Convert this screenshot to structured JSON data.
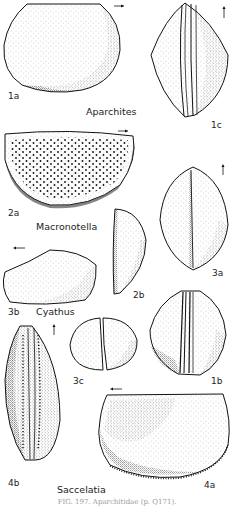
{
  "figure": {
    "caption": "FIG. 197. Aparchitidae (p. Q171).",
    "genera": [
      {
        "id": "aparchites",
        "name": "Aparchites"
      },
      {
        "id": "macronotella",
        "name": "Macronotella"
      },
      {
        "id": "cyathus",
        "name": "Cyathus"
      },
      {
        "id": "saccelatia",
        "name": "Saccelatia"
      }
    ],
    "panels": [
      {
        "id": "1a",
        "label": "1a",
        "genus": "Aparchites",
        "view": "lateral",
        "orientation_arrow": "right"
      },
      {
        "id": "1b",
        "label": "1b",
        "genus": "Aparchites",
        "view": "ventral"
      },
      {
        "id": "1c",
        "label": "1c",
        "genus": "Aparchites",
        "view": "dorsal",
        "orientation_arrow": "up"
      },
      {
        "id": "2a",
        "label": "2a",
        "genus": "Macronotella",
        "view": "lateral",
        "orientation_arrow": "right"
      },
      {
        "id": "2b",
        "label": "2b",
        "genus": "Macronotella",
        "view": "end"
      },
      {
        "id": "3a",
        "label": "3a",
        "genus": "Cyathus",
        "view": "dorsal",
        "orientation_arrow": "up"
      },
      {
        "id": "3b",
        "label": "3b",
        "genus": "Cyathus",
        "view": "lateral",
        "orientation_arrow": "left"
      },
      {
        "id": "3c",
        "label": "3c",
        "genus": "Cyathus",
        "view": "end"
      },
      {
        "id": "4a",
        "label": "4a",
        "genus": "Saccelatia",
        "view": "lateral",
        "orientation_arrow": "left"
      },
      {
        "id": "4b",
        "label": "4b",
        "genus": "Saccelatia",
        "view": "dorsal",
        "orientation_arrow": "up"
      }
    ]
  },
  "colors": {
    "ink": "#1a1a1a",
    "paper": "#ffffff",
    "caption": "#9a9a9a"
  }
}
